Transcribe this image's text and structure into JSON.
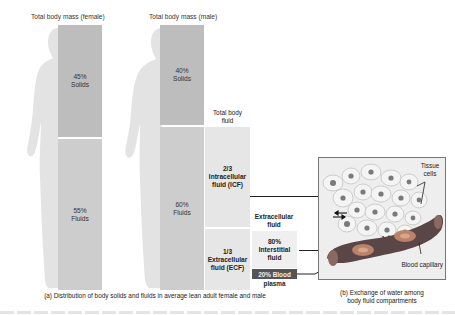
{
  "female": {
    "title": "Total body mass (female)",
    "solids": {
      "percent": "45%",
      "label": "Solids"
    },
    "fluids": {
      "percent": "55%",
      "label": "Fluids"
    }
  },
  "male": {
    "title": "Total body mass (male)",
    "solids": {
      "percent": "40%",
      "label": "Solids"
    },
    "fluids": {
      "percent": "60%",
      "label": "Fluids"
    }
  },
  "total_body_fluid": {
    "title_line1": "Total body",
    "title_line2": "fluid",
    "icf": {
      "fraction": "2/3",
      "line1": "Intracellular",
      "line2": "fluid (ICF)"
    },
    "ecf": {
      "fraction": "1/3",
      "line1": "Extracellular",
      "line2": "fluid (ECF)"
    }
  },
  "extracellular_fluid": {
    "title_line1": "Extracellular",
    "title_line2": "fluid",
    "interstitial": {
      "percent": "80%",
      "line1": "Interstitial",
      "line2": "fluid"
    },
    "plasma": {
      "label_box": "20% Blood",
      "label_below": "plasma"
    }
  },
  "panel_b": {
    "tissue_cells_line1": "Tissue",
    "tissue_cells_line2": "cells",
    "blood_capillary": "Blood capillary"
  },
  "captions": {
    "a": "(a) Distribution of body solids and fluids in average lean adult female and male",
    "b_line1": "(b) Exchange of water among",
    "b_line2": "body fluid compartments"
  },
  "colors": {
    "silhouette": "#e3e3e3",
    "solids": "#bdbdbd",
    "fluids": "#cdcdcd",
    "plasma_box": "#555555",
    "capillary": "#5a4646",
    "rbc": "#b9826a"
  }
}
